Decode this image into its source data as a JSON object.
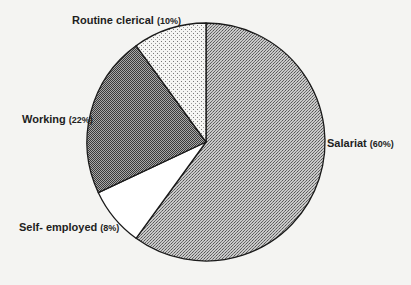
{
  "chart_data": {
    "type": "pie",
    "title": "",
    "start_angle_deg": 0,
    "direction": "clockwise",
    "center": [
      206,
      142
    ],
    "radius": 119,
    "slices": [
      {
        "label": "Salariat",
        "value": 60,
        "pct_text": "(60%)",
        "pattern": "fine-checker-medium",
        "color": "#9a9a9a"
      },
      {
        "label": "Self- employed",
        "value": 8,
        "pct_text": "(8%)",
        "pattern": "none",
        "color": "#ffffff"
      },
      {
        "label": "Working",
        "value": 22,
        "pct_text": "(22%)",
        "pattern": "fine-checker-dark",
        "color": "#6e6e6e"
      },
      {
        "label": "Routine clerical",
        "value": 10,
        "pct_text": "(10%)",
        "pattern": "dots",
        "color": "#e8e8e8"
      }
    ],
    "legend": "none",
    "grid": false
  },
  "labels": {
    "salariat": {
      "name": "Salariat",
      "pct": "(60%)"
    },
    "self_employed": {
      "name": "Self- employed",
      "pct": "(8%)"
    },
    "working": {
      "name": "Working",
      "pct": "(22%)"
    },
    "routine": {
      "name": "Routine clerical",
      "pct": "(10%)"
    }
  }
}
